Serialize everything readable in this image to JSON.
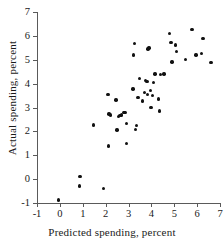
{
  "chart_data": {
    "type": "scatter",
    "title": "",
    "xlabel": "Predicted spending, percent",
    "ylabel": "Actual spending, percent",
    "xlim": [
      -1,
      7
    ],
    "ylim": [
      -1,
      7
    ],
    "xticks": [
      -1,
      0,
      1,
      2,
      3,
      4,
      5,
      6,
      7
    ],
    "yticks": [
      -1,
      0,
      1,
      2,
      3,
      4,
      5,
      6,
      7
    ],
    "xtick_labels": [
      "-1",
      "0",
      "1",
      "2",
      "3",
      "4",
      "5",
      "6",
      "7"
    ],
    "ytick_labels": [
      "-1",
      "0",
      "1",
      "2",
      "3",
      "4",
      "5",
      "6",
      "7"
    ],
    "grid": false,
    "legend": null,
    "marker": "filled-circle",
    "marker_color": "#111111",
    "points": [
      [
        -0.05,
        -0.88
      ],
      [
        0.88,
        0.12
      ],
      [
        0.85,
        -0.28
      ],
      [
        1.9,
        -0.4
      ],
      [
        1.48,
        2.26
      ],
      [
        2.1,
        3.55
      ],
      [
        2.12,
        1.38
      ],
      [
        2.15,
        2.72
      ],
      [
        2.2,
        2.68
      ],
      [
        2.45,
        3.32
      ],
      [
        2.5,
        2.05
      ],
      [
        2.55,
        2.62
      ],
      [
        2.62,
        2.66
      ],
      [
        2.7,
        2.68
      ],
      [
        2.8,
        2.78
      ],
      [
        2.85,
        2.8
      ],
      [
        2.9,
        2.32
      ],
      [
        2.92,
        1.48
      ],
      [
        3.25,
        5.68
      ],
      [
        3.22,
        5.2
      ],
      [
        3.2,
        3.78
      ],
      [
        3.3,
        2.08
      ],
      [
        3.35,
        2.24
      ],
      [
        3.42,
        3.42
      ],
      [
        3.48,
        4.22
      ],
      [
        3.6,
        3.28
      ],
      [
        3.7,
        3.62
      ],
      [
        3.75,
        4.12
      ],
      [
        3.8,
        4.08
      ],
      [
        3.82,
        3.55
      ],
      [
        3.85,
        5.45
      ],
      [
        3.9,
        5.5
      ],
      [
        3.95,
        3.72
      ],
      [
        3.98,
        3.0
      ],
      [
        4.05,
        3.5
      ],
      [
        4.1,
        4.05
      ],
      [
        4.15,
        4.4
      ],
      [
        4.3,
        3.35
      ],
      [
        4.35,
        2.85
      ],
      [
        4.4,
        4.38
      ],
      [
        4.55,
        4.4
      ],
      [
        4.8,
        6.1
      ],
      [
        4.85,
        5.72
      ],
      [
        4.9,
        4.9
      ],
      [
        5.05,
        5.62
      ],
      [
        5.1,
        5.35
      ],
      [
        5.5,
        5.02
      ],
      [
        5.78,
        6.28
      ],
      [
        5.95,
        5.2
      ],
      [
        6.2,
        5.25
      ],
      [
        6.25,
        5.9
      ],
      [
        6.6,
        4.88
      ]
    ]
  }
}
